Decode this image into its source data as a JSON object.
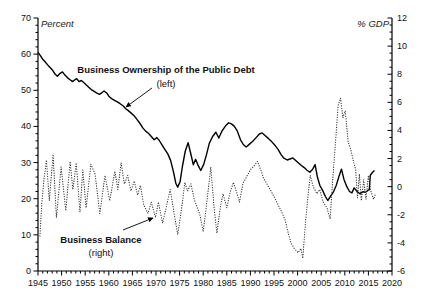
{
  "chart_data": {
    "type": "line",
    "title": "",
    "grid": "off",
    "legend": "annotations-inside-plot",
    "x_axis": {
      "min": 1945,
      "max": 2020,
      "major_tick_step": 5,
      "minor_tick_step": 1
    },
    "left_axis": {
      "title": "Percent",
      "min": 0,
      "max": 70,
      "major_tick_step": 10,
      "minor_tick_step": 2
    },
    "right_axis": {
      "title": "% GDP",
      "min": -6,
      "max": 12,
      "major_tick_step": 2,
      "minor_tick_step": 0.5
    },
    "series": [
      {
        "name": "Business Ownership of the Public Debt",
        "axis": "left",
        "style": "solid",
        "color": "#000000",
        "points": [
          [
            1945,
            60.5
          ],
          [
            1945.5,
            59.6
          ],
          [
            1946,
            58.6
          ],
          [
            1946.5,
            57.9
          ],
          [
            1947,
            57.1
          ],
          [
            1947.5,
            56.4
          ],
          [
            1948,
            55.7
          ],
          [
            1948.6,
            54.5
          ],
          [
            1949.1,
            53.9
          ],
          [
            1949.6,
            54.6
          ],
          [
            1950.2,
            55.1
          ],
          [
            1950.7,
            54.2
          ],
          [
            1951.2,
            53.5
          ],
          [
            1951.8,
            52.9
          ],
          [
            1952.3,
            52.4
          ],
          [
            1952.8,
            52.9
          ],
          [
            1953.2,
            53.2
          ],
          [
            1953.7,
            52.4
          ],
          [
            1954.2,
            52.7
          ],
          [
            1954.8,
            52.0
          ],
          [
            1955.3,
            51.4
          ],
          [
            1955.8,
            50.8
          ],
          [
            1956.3,
            50.2
          ],
          [
            1956.9,
            49.7
          ],
          [
            1957.4,
            49.3
          ],
          [
            1958,
            48.9
          ],
          [
            1958.5,
            49.3
          ],
          [
            1959,
            49.8
          ],
          [
            1959.6,
            49.2
          ],
          [
            1960.1,
            48.2
          ],
          [
            1960.6,
            47.7
          ],
          [
            1961.2,
            47.2
          ],
          [
            1961.8,
            46.8
          ],
          [
            1962.4,
            46.3
          ],
          [
            1963,
            45.7
          ],
          [
            1963.6,
            44.9
          ],
          [
            1964.2,
            44.3
          ],
          [
            1964.8,
            43.6
          ],
          [
            1965.4,
            42.9
          ],
          [
            1966,
            41.9
          ],
          [
            1966.6,
            40.8
          ],
          [
            1967.2,
            39.6
          ],
          [
            1967.8,
            38.7
          ],
          [
            1968.4,
            38.1
          ],
          [
            1969,
            37.2
          ],
          [
            1969.6,
            36.3
          ],
          [
            1970.2,
            36.9
          ],
          [
            1970.7,
            36.1
          ],
          [
            1971.3,
            34.8
          ],
          [
            1971.9,
            33.6
          ],
          [
            1972.5,
            32.4
          ],
          [
            1973.1,
            30.6
          ],
          [
            1973.7,
            27.4
          ],
          [
            1974.2,
            24.3
          ],
          [
            1974.6,
            23.2
          ],
          [
            1975.1,
            24.7
          ],
          [
            1975.6,
            28.9
          ],
          [
            1976.2,
            33.2
          ],
          [
            1976.8,
            35.5
          ],
          [
            1977.3,
            32.8
          ],
          [
            1977.9,
            29.4
          ],
          [
            1978.4,
            30.9
          ],
          [
            1979,
            29.0
          ],
          [
            1979.5,
            27.8
          ],
          [
            1980.1,
            29.5
          ],
          [
            1980.7,
            32.2
          ],
          [
            1981.3,
            35.3
          ],
          [
            1982,
            37.2
          ],
          [
            1982.7,
            38.4
          ],
          [
            1983.3,
            36.8
          ],
          [
            1984,
            38.8
          ],
          [
            1984.7,
            40.1
          ],
          [
            1985.4,
            41.0
          ],
          [
            1986,
            40.7
          ],
          [
            1986.6,
            40.0
          ],
          [
            1987.2,
            38.8
          ],
          [
            1987.9,
            36.3
          ],
          [
            1988.5,
            35.0
          ],
          [
            1989.1,
            34.3
          ],
          [
            1989.8,
            35.1
          ],
          [
            1990.5,
            35.9
          ],
          [
            1991.2,
            36.9
          ],
          [
            1991.9,
            37.9
          ],
          [
            1992.5,
            38.2
          ],
          [
            1993.1,
            37.5
          ],
          [
            1993.8,
            36.7
          ],
          [
            1994.5,
            35.8
          ],
          [
            1995.2,
            34.8
          ],
          [
            1995.9,
            33.6
          ],
          [
            1996.5,
            32.2
          ],
          [
            1997.1,
            31.2
          ],
          [
            1997.8,
            30.7
          ],
          [
            1998.4,
            31.0
          ],
          [
            1999,
            31.3
          ],
          [
            1999.6,
            30.6
          ],
          [
            2000.2,
            29.9
          ],
          [
            2000.8,
            29.2
          ],
          [
            2001.4,
            28.6
          ],
          [
            2002,
            27.9
          ],
          [
            2002.6,
            27.3
          ],
          [
            2003.2,
            28.2
          ],
          [
            2003.7,
            29.4
          ],
          [
            2004.2,
            26.0
          ],
          [
            2004.7,
            23.7
          ],
          [
            2005.3,
            22.3
          ],
          [
            2005.9,
            20.6
          ],
          [
            2006.4,
            19.5
          ],
          [
            2007,
            20.7
          ],
          [
            2007.6,
            21.9
          ],
          [
            2008.2,
            23.7
          ],
          [
            2008.8,
            26.3
          ],
          [
            2009.3,
            28.2
          ],
          [
            2009.8,
            25.4
          ],
          [
            2010.4,
            23.4
          ],
          [
            2011,
            22.0
          ],
          [
            2011.5,
            21.6
          ],
          [
            2012,
            23.0
          ],
          [
            2012.6,
            22.0
          ],
          [
            2013.2,
            21.4
          ],
          [
            2013.8,
            21.9
          ],
          [
            2014.4,
            21.8
          ],
          [
            2014.9,
            22.3
          ],
          [
            2015.2,
            22.5
          ],
          [
            2015.4,
            26.5
          ],
          [
            2015.9,
            27.3
          ],
          [
            2016.3,
            27.8
          ]
        ]
      },
      {
        "name": "Business Balance",
        "axis": "right",
        "style": "dotted",
        "color": "#333333",
        "points": [
          [
            1945.4,
            -3.5
          ],
          [
            1945.8,
            -1.2
          ],
          [
            1946.3,
            0.6
          ],
          [
            1946.8,
            1.9
          ],
          [
            1947.4,
            -1.0
          ],
          [
            1948.2,
            2.3
          ],
          [
            1948.9,
            -2.2
          ],
          [
            1949.9,
            1.4
          ],
          [
            1950.9,
            -1.7
          ],
          [
            1951.8,
            1.8
          ],
          [
            1952.4,
            -0.2
          ],
          [
            1953.1,
            1.7
          ],
          [
            1953.9,
            -1.8
          ],
          [
            1954.5,
            1.2
          ],
          [
            1955.2,
            -1.5
          ],
          [
            1956.2,
            1.6
          ],
          [
            1957.1,
            0.9
          ],
          [
            1958.1,
            -1.9
          ],
          [
            1959.2,
            0.8
          ],
          [
            1960.2,
            -1.0
          ],
          [
            1961.3,
            1.1
          ],
          [
            1961.9,
            -0.2
          ],
          [
            1962.6,
            1.7
          ],
          [
            1963.3,
            0.2
          ],
          [
            1964,
            0.8
          ],
          [
            1964.7,
            -0.3
          ],
          [
            1965.4,
            0.4
          ],
          [
            1966.1,
            -0.6
          ],
          [
            1966.7,
            0.1
          ],
          [
            1967.4,
            -1.3
          ],
          [
            1968.3,
            -1.9
          ],
          [
            1969,
            -1.1
          ],
          [
            1969.9,
            -2.2
          ],
          [
            1970.5,
            -1.1
          ],
          [
            1971.4,
            -2.6
          ],
          [
            1972.2,
            -1.4
          ],
          [
            1973,
            -0.2
          ],
          [
            1973.8,
            -1.8
          ],
          [
            1974.6,
            -3.4
          ],
          [
            1975.4,
            -1.6
          ],
          [
            1976.1,
            0.3
          ],
          [
            1976.7,
            -0.3
          ],
          [
            1977.4,
            0.2
          ],
          [
            1978.1,
            -0.9
          ],
          [
            1979.3,
            -2.0
          ],
          [
            1980,
            -3.2
          ],
          [
            1980.8,
            -1.0
          ],
          [
            1981.6,
            1.4
          ],
          [
            1982.3,
            -1.5
          ],
          [
            1982.9,
            -3.3
          ],
          [
            1983.6,
            -1.5
          ],
          [
            1984.2,
            -0.5
          ],
          [
            1985,
            -1.5
          ],
          [
            1985.7,
            -0.4
          ],
          [
            1986.4,
            0.3
          ],
          [
            1987,
            -0.3
          ],
          [
            1987.7,
            -1.1
          ],
          [
            1988.4,
            0.2
          ],
          [
            1989.2,
            0.7
          ],
          [
            1990,
            1.2
          ],
          [
            1990.8,
            1.5
          ],
          [
            1991.5,
            1.8
          ],
          [
            1992.2,
            1.2
          ],
          [
            1992.8,
            0.6
          ],
          [
            1993.5,
            0.2
          ],
          [
            1994.2,
            -0.2
          ],
          [
            1995,
            -0.7
          ],
          [
            1995.9,
            -1.3
          ],
          [
            1996.6,
            -1.8
          ],
          [
            1997.4,
            -2.4
          ],
          [
            1998,
            -3.3
          ],
          [
            1998.6,
            -4.0
          ],
          [
            1999.3,
            -4.4
          ],
          [
            2000.1,
            -4.7
          ],
          [
            2000.7,
            -4.4
          ],
          [
            2001.1,
            -5.1
          ],
          [
            2001.7,
            -2.4
          ],
          [
            2002.3,
            -0.3
          ],
          [
            2002.7,
            0.8
          ],
          [
            2003.3,
            0.0
          ],
          [
            2004.1,
            -0.5
          ],
          [
            2004.7,
            -0.2
          ],
          [
            2005.4,
            -1.1
          ],
          [
            2006.2,
            -1.5
          ],
          [
            2006.9,
            -2.3
          ],
          [
            2007.5,
            0.8
          ],
          [
            2008.1,
            3.5
          ],
          [
            2008.6,
            5.8
          ],
          [
            2009.1,
            6.3
          ],
          [
            2009.6,
            4.9
          ],
          [
            2010.1,
            5.4
          ],
          [
            2010.7,
            3.2
          ],
          [
            2011.3,
            2.6
          ],
          [
            2011.9,
            1.7
          ],
          [
            2012.3,
            1.2
          ],
          [
            2012.7,
            -0.8
          ],
          [
            2013.1,
            0.9
          ],
          [
            2013.5,
            -1.0
          ],
          [
            2014,
            0.5
          ],
          [
            2014.5,
            -0.9
          ],
          [
            2015,
            0.8
          ],
          [
            2015.5,
            -0.3
          ],
          [
            2016.1,
            -0.9
          ],
          [
            2016.5,
            -0.5
          ]
        ]
      }
    ],
    "annotations": [
      {
        "name": "ownership-series-label",
        "x": 166,
        "lines": [
          {
            "text": "Business Ownership of the Public Debt",
            "y": 73,
            "bold": true,
            "size": 9.5
          },
          {
            "text": "(left)",
            "y": 87,
            "bold": false,
            "size": 9.5
          }
        ],
        "arrow": {
          "x1": 152,
          "y1": 88,
          "x2": 126,
          "y2": 107
        }
      },
      {
        "name": "balance-series-label",
        "x": 101,
        "lines": [
          {
            "text": "Business Balance",
            "y": 243,
            "bold": true,
            "size": 9.5
          },
          {
            "text": "(right)",
            "y": 256,
            "bold": false,
            "size": 9.5
          }
        ],
        "arrow": {
          "x1": 123,
          "y1": 230,
          "x2": 153,
          "y2": 218
        }
      }
    ]
  }
}
